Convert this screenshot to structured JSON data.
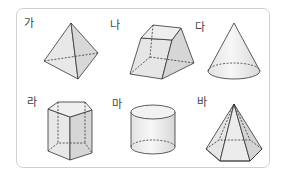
{
  "figure": {
    "items": [
      {
        "label": "가",
        "shape": "triangular-pyramid"
      },
      {
        "label": "나",
        "shape": "square-frustum"
      },
      {
        "label": "다",
        "shape": "cone"
      },
      {
        "label": "라",
        "shape": "pentagonal-prism"
      },
      {
        "label": "마",
        "shape": "cylinder"
      },
      {
        "label": "바",
        "shape": "hexagonal-pyramid"
      }
    ],
    "colors": {
      "border": "#cfcfcf",
      "stroke": "#333333",
      "fill": "#e6e6e6",
      "label": "#444444"
    }
  }
}
